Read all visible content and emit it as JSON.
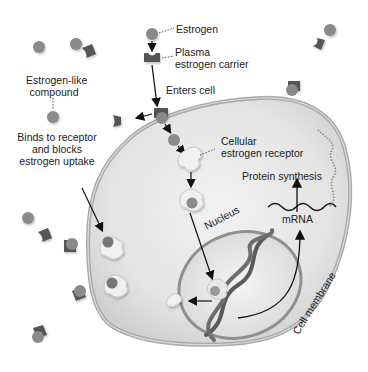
{
  "labels": {
    "estrogen": "Estrogen",
    "carrier_line1": "Plasma",
    "carrier_line2": "estrogen carrier",
    "enters_cell": "Enters cell",
    "estrogen_like_line1": "Estrogen-like",
    "estrogen_like_line2": "compound",
    "binds_line1": "Binds to receptor",
    "binds_line2": "and blocks",
    "binds_line3": "estrogen uptake",
    "receptor_line1": "Cellular",
    "receptor_line2": "estrogen receptor",
    "protein_synthesis": "Protein synthesis",
    "mrna": "mRNA",
    "nucleus": "Nucleus",
    "cell_membrane": "Cell membrane"
  },
  "colors": {
    "estrogen": "#8a8a8a",
    "carrier": "#555555",
    "cytoplasm": "#e6e6e6",
    "membrane": "#b5b5b5",
    "nucleus_fill": "#dcdcdc",
    "receptor": "#f0f0f0",
    "text": "#222222"
  }
}
